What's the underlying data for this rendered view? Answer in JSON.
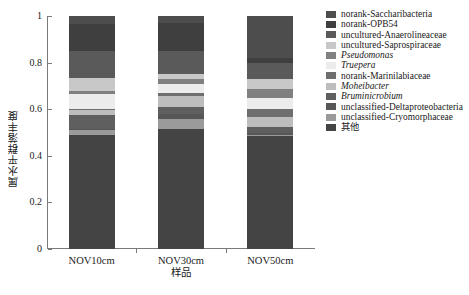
{
  "chart_data": {
    "type": "bar",
    "subtype": "stacked-bar-100-percent",
    "title": "",
    "xlabel": "样品",
    "ylabel": "属水平群落丰度",
    "categories": [
      "NOV10cm",
      "NOV30cm",
      "NOV50cm"
    ],
    "ylim": [
      0,
      1
    ],
    "yticks": [
      0,
      0.2,
      0.4,
      0.6,
      0.8,
      1
    ],
    "ytick_labels": [
      "0",
      "0.2",
      "0.4",
      "0.6",
      "0.8",
      "1"
    ],
    "grid": false,
    "legend_position": "right",
    "stack_order": "bottom-to-top is reverse of legend order",
    "series": [
      {
        "name": "norank-Saccharibacteria",
        "color": "#4d4d4d",
        "values": [
          0.035,
          0.03,
          0.18
        ]
      },
      {
        "name": "norank-OPB54",
        "color": "#3f3f3f",
        "values": [
          0.115,
          0.12,
          0.02
        ]
      },
      {
        "name": "uncultured-Anaerolineaceae",
        "color": "#5a5a5a",
        "values": [
          0.115,
          0.1,
          0.07
        ]
      },
      {
        "name": "uncultured-Saprospiraceae",
        "color": "#c8c8c8",
        "values": [
          0.055,
          0.02,
          0.045
        ]
      },
      {
        "name": "Pseudomonas",
        "color": "#808080",
        "values": [
          0.015,
          0.02,
          0.035
        ]
      },
      {
        "name": "Truepera",
        "color": "#ececec",
        "values": [
          0.065,
          0.04,
          0.05
        ]
      },
      {
        "name": "norank-Marinilabiaceae",
        "color": "#6e6e6e",
        "values": [
          0.005,
          0.015,
          0.035
        ]
      },
      {
        "name": "Moheibacter",
        "color": "#bdbdbd",
        "values": [
          0.02,
          0.045,
          0.04
        ]
      },
      {
        "name": "Bruminicrobium",
        "color": "#5f5f5f",
        "values": [
          0.06,
          0.03,
          0.025
        ]
      },
      {
        "name": "unclassified-Deltaproteobacteria",
        "color": "#575757",
        "values": [
          0.005,
          0.02,
          0.01
        ]
      },
      {
        "name": "unclassified-Cryomorphaceae",
        "color": "#9a9a9a",
        "values": [
          0.02,
          0.045,
          0.005
        ]
      },
      {
        "name": "其他",
        "color": "#444444",
        "values": [
          0.49,
          0.515,
          0.485
        ]
      }
    ]
  },
  "legend": {
    "items": [
      {
        "label": "norank-Saccharibacteria",
        "color": "#4d4d4d",
        "italic": false
      },
      {
        "label": "norank-OPB54",
        "color": "#3f3f3f",
        "italic": false
      },
      {
        "label": "uncultured-Anaerolineaceae",
        "color": "#5a5a5a",
        "italic": false
      },
      {
        "label": "uncultured-Saprospiraceae",
        "color": "#c8c8c8",
        "italic": false
      },
      {
        "label": "Pseudomonas",
        "color": "#808080",
        "italic": true
      },
      {
        "label": "Truepera",
        "color": "#ececec",
        "italic": true
      },
      {
        "label": "norank-Marinilabiaceae",
        "color": "#6e6e6e",
        "italic": false
      },
      {
        "label": "Moheibacter",
        "color": "#bdbdbd",
        "italic": true
      },
      {
        "label": "Bruminicrobium",
        "color": "#5f5f5f",
        "italic": true
      },
      {
        "label": "unclassified-Deltaproteobacteria",
        "color": "#575757",
        "italic": false
      },
      {
        "label": "unclassified-Cryomorphaceae",
        "color": "#9a9a9a",
        "italic": false
      },
      {
        "label": "其他",
        "color": "#444444",
        "italic": false
      }
    ]
  },
  "axes": {
    "y_title": "属水平群落丰度",
    "x_title": "样品",
    "axis_color": "#7a7a7a"
  }
}
